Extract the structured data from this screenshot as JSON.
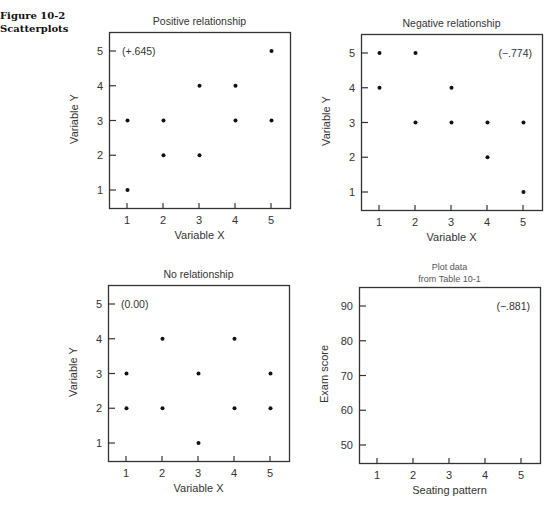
{
  "figure": {
    "number": "Figure 10-2",
    "caption": "Scatterplots"
  },
  "chart_data": [
    {
      "type": "scatter",
      "title": "Positive relationship",
      "xlabel": "Variable X",
      "ylabel": "Variable Y",
      "annotation": "(+.645)",
      "xlim": [
        0.5,
        5.5
      ],
      "ylim": [
        0.5,
        5.5
      ],
      "xticks": [
        1,
        2,
        3,
        4,
        5
      ],
      "yticks": [
        1,
        2,
        3,
        4,
        5
      ],
      "grid": false,
      "points": [
        [
          1,
          1
        ],
        [
          1,
          3
        ],
        [
          2,
          2
        ],
        [
          2,
          3
        ],
        [
          3,
          2
        ],
        [
          3,
          4
        ],
        [
          4,
          3
        ],
        [
          4,
          4
        ],
        [
          5,
          3
        ],
        [
          5,
          5
        ]
      ]
    },
    {
      "type": "scatter",
      "title": "Negative relationship",
      "xlabel": "Variable X",
      "ylabel": "Variable Y",
      "annotation": "(−.774)",
      "xlim": [
        0.5,
        5.5
      ],
      "ylim": [
        0.5,
        5.5
      ],
      "xticks": [
        1,
        2,
        3,
        4,
        5
      ],
      "yticks": [
        1,
        2,
        3,
        4,
        5
      ],
      "grid": false,
      "points": [
        [
          1,
          5
        ],
        [
          1,
          4
        ],
        [
          2,
          5
        ],
        [
          2,
          3
        ],
        [
          3,
          4
        ],
        [
          3,
          3
        ],
        [
          4,
          3
        ],
        [
          4,
          2
        ],
        [
          5,
          3
        ],
        [
          5,
          1
        ]
      ]
    },
    {
      "type": "scatter",
      "title": "No relationship",
      "xlabel": "Variable X",
      "ylabel": "Variable Y",
      "annotation": "(0.00)",
      "xlim": [
        0.5,
        5.5
      ],
      "ylim": [
        0.5,
        5.5
      ],
      "xticks": [
        1,
        2,
        3,
        4,
        5
      ],
      "yticks": [
        1,
        2,
        3,
        4,
        5
      ],
      "grid": false,
      "points": [
        [
          1,
          3
        ],
        [
          1,
          2
        ],
        [
          2,
          4
        ],
        [
          2,
          2
        ],
        [
          3,
          3
        ],
        [
          3,
          1
        ],
        [
          4,
          4
        ],
        [
          4,
          2
        ],
        [
          5,
          3
        ],
        [
          5,
          2
        ]
      ]
    },
    {
      "type": "scatter",
      "title": "Plot data from Table 10-1",
      "title_lines": [
        "Plot data",
        "from Table 10-1"
      ],
      "xlabel": "Seating pattern",
      "ylabel": "Exam score",
      "annotation": "(−.881)",
      "xlim": [
        0.5,
        5.5
      ],
      "ylim": [
        45,
        95
      ],
      "xticks": [
        1,
        2,
        3,
        4,
        5
      ],
      "yticks": [
        50,
        60,
        70,
        80,
        90
      ],
      "grid": false,
      "points": []
    }
  ]
}
